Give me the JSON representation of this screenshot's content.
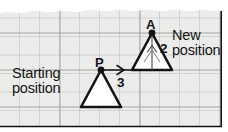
{
  "figure": {
    "kind": "geometry-translation-diagram",
    "medium": "graph-paper",
    "background_color": "#ffffff",
    "paper_color": "#ececeb",
    "grid_color": "#b9b9b9",
    "grid_major_color": "#9a9a9a",
    "ink_color": "#141414",
    "text_color": "#141414"
  },
  "labels": {
    "starting_line1": "Starting",
    "starting_line2": "position",
    "new_line1": "New",
    "new_line2": "position",
    "point_p": "P",
    "point_a": "A",
    "vector_x": "3",
    "vector_y": "2"
  },
  "geometry": {
    "grid_spacing_x": 20,
    "grid_spacing_y": 18.5,
    "start_triangle": {
      "apex": [
        101,
        70
      ],
      "base_left": [
        81,
        107
      ],
      "base_right": [
        121,
        107
      ],
      "fill": "#ffffff",
      "stroke": "#141414"
    },
    "new_triangle": {
      "apex": [
        152,
        33
      ],
      "base_left": [
        132,
        70
      ],
      "base_right": [
        172,
        70
      ],
      "fill": "#ffffff",
      "stroke": "#141414"
    },
    "translation_horizontal": {
      "from": [
        101,
        70
      ],
      "to": [
        152,
        70
      ],
      "magnitude": "3"
    },
    "translation_vertical": {
      "from": [
        152,
        70
      ],
      "to": [
        152,
        45
      ],
      "magnitude": "2"
    },
    "vertex_dot_radius": 3.2
  }
}
